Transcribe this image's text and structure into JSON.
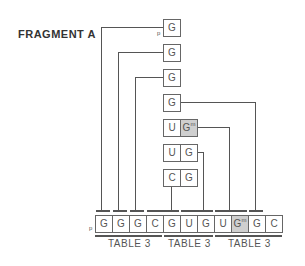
{
  "title": "FRAGMENT A",
  "prefix": "p",
  "stack": [
    {
      "cells": [
        "G"
      ]
    },
    {
      "cells": [
        "G"
      ]
    },
    {
      "cells": [
        "G"
      ]
    },
    {
      "cells": [
        "G"
      ]
    },
    {
      "cells": [
        "U",
        "Gm"
      ]
    },
    {
      "cells": [
        "U",
        "G"
      ]
    },
    {
      "cells": [
        "C",
        "G"
      ]
    }
  ],
  "sequence": [
    "G",
    "G",
    "G",
    "C",
    "G",
    "U",
    "G",
    "U",
    "Gm",
    "G",
    "C"
  ],
  "modified_superscript": "m",
  "table_labels": [
    "TABLE 3",
    "TABLE 3",
    "TABLE 3"
  ],
  "colors": {
    "line": "#555555",
    "shaded": "#cfcfcf"
  }
}
